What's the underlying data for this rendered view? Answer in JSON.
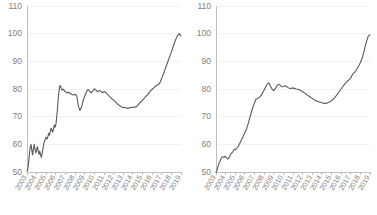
{
  "figure": {
    "title": "",
    "panel_count": 2,
    "background_color": "#ffffff",
    "line_color": "#595959",
    "axis_color": "#bfbfbf",
    "grid_color": "#f2f2f2",
    "tick_label_color": "#808080"
  },
  "chart_data": [
    {
      "type": "line",
      "title": "",
      "subtitle": "",
      "xlabel": "",
      "ylabel": "",
      "panel": "left",
      "grid": true,
      "legend": "none",
      "ylim": [
        50,
        110
      ],
      "yticks": [
        50,
        60,
        70,
        80,
        90,
        100,
        110
      ],
      "ytick_labels": [
        "50",
        "60",
        "70",
        "80",
        "90",
        "100",
        "110"
      ],
      "xlim": [
        2003,
        2019
      ],
      "xticks": [
        2003,
        2004,
        2005,
        2006,
        2007,
        2008,
        2009,
        2010,
        2011,
        2012,
        2013,
        2014,
        2015,
        2016,
        2017,
        2018,
        2019
      ],
      "xtick_labels": [
        "2003",
        "2004",
        "2005",
        "2006",
        "2007",
        "2008",
        "2009",
        "2010",
        "2011",
        "2012",
        "2013",
        "2014",
        "2015",
        "2016",
        "2017",
        "2018",
        "2019"
      ],
      "xtick_rotation": -60,
      "series": [
        {
          "name": "index",
          "color": "#595959",
          "x": [
            2003.0,
            2003.08,
            2003.17,
            2003.25,
            2003.33,
            2003.42,
            2003.5,
            2003.58,
            2003.67,
            2003.75,
            2003.83,
            2003.92,
            2004.0,
            2004.08,
            2004.17,
            2004.25,
            2004.33,
            2004.42,
            2004.5,
            2004.58,
            2004.67,
            2004.75,
            2004.83,
            2004.92,
            2005.0,
            2005.08,
            2005.17,
            2005.25,
            2005.33,
            2005.42,
            2005.5,
            2005.58,
            2005.67,
            2005.75,
            2005.83,
            2005.92,
            2006.0,
            2006.08,
            2006.17,
            2006.25,
            2006.33,
            2006.42,
            2006.5,
            2006.58,
            2006.67,
            2006.75,
            2006.83,
            2006.92,
            2007.0,
            2007.17,
            2007.33,
            2007.5,
            2007.67,
            2007.83,
            2008.0,
            2008.17,
            2008.33,
            2008.5,
            2008.67,
            2008.83,
            2009.0,
            2009.17,
            2009.33,
            2009.5,
            2009.67,
            2009.83,
            2010.0,
            2010.17,
            2010.33,
            2010.5,
            2010.67,
            2010.83,
            2011.0,
            2011.17,
            2011.33,
            2011.5,
            2011.67,
            2011.83,
            2012.0,
            2012.17,
            2012.33,
            2012.5,
            2012.67,
            2012.83,
            2013.0,
            2013.17,
            2013.33,
            2013.5,
            2013.67,
            2013.83,
            2014.0,
            2014.17,
            2014.33,
            2014.5,
            2014.67,
            2014.83,
            2015.0,
            2015.17,
            2015.33,
            2015.5,
            2015.67,
            2015.83,
            2016.0,
            2016.17,
            2016.33,
            2016.5,
            2016.67,
            2016.83,
            2017.0,
            2017.17,
            2017.33,
            2017.5,
            2017.67,
            2017.83,
            2018.0,
            2018.17,
            2018.33,
            2018.5,
            2018.67,
            2018.83,
            2019.0
          ],
          "values": [
            50.3,
            51.0,
            53.5,
            56.5,
            58.8,
            59.9,
            58.0,
            56.2,
            58.4,
            60.0,
            58.3,
            56.9,
            57.9,
            59.2,
            57.6,
            56.4,
            57.5,
            56.0,
            55.3,
            56.8,
            58.6,
            60.3,
            61.2,
            62.0,
            62.6,
            61.9,
            62.8,
            64.0,
            63.3,
            64.6,
            65.9,
            65.2,
            64.4,
            65.5,
            67.0,
            66.2,
            67.1,
            69.5,
            73.0,
            76.8,
            79.4,
            81.3,
            80.9,
            80.1,
            79.6,
            80.0,
            79.7,
            79.2,
            79.0,
            78.6,
            78.8,
            78.4,
            78.0,
            77.8,
            78.1,
            77.5,
            74.0,
            72.2,
            73.5,
            75.8,
            77.4,
            78.9,
            79.8,
            79.2,
            78.6,
            79.3,
            80.1,
            79.6,
            79.0,
            79.4,
            79.2,
            78.6,
            79.1,
            78.8,
            78.2,
            77.6,
            77.0,
            76.4,
            76.0,
            75.4,
            74.8,
            74.3,
            73.9,
            73.5,
            73.2,
            73.4,
            73.1,
            73.0,
            73.2,
            73.4,
            73.3,
            73.6,
            73.5,
            74.1,
            74.8,
            75.4,
            75.9,
            76.6,
            77.3,
            77.8,
            78.6,
            79.3,
            79.9,
            80.4,
            81.0,
            81.4,
            81.6,
            82.4,
            83.9,
            85.4,
            87.0,
            88.6,
            90.2,
            91.8,
            93.4,
            95.1,
            96.8,
            98.3,
            99.5,
            100.0,
            99.2
          ]
        }
      ]
    },
    {
      "type": "line",
      "title": "",
      "subtitle": "",
      "xlabel": "",
      "ylabel": "",
      "panel": "right",
      "grid": true,
      "legend": "none",
      "ylim": [
        50,
        110
      ],
      "yticks": [
        50,
        60,
        70,
        80,
        90,
        100,
        110
      ],
      "ytick_labels": [
        "50",
        "60",
        "70",
        "80",
        "90",
        "100",
        "110"
      ],
      "xlim": [
        2003,
        2019
      ],
      "xticks": [
        2003,
        2004,
        2005,
        2006,
        2007,
        2008,
        2009,
        2010,
        2011,
        2012,
        2013,
        2014,
        2015,
        2016,
        2017,
        2018,
        2019
      ],
      "xtick_labels": [
        "2003",
        "2004",
        "2005",
        "2006",
        "2007",
        "2008",
        "2009",
        "2010",
        "2011",
        "2012",
        "2013",
        "2014",
        "2015",
        "2016",
        "2017",
        "2018",
        "2019"
      ],
      "xtick_rotation": -60,
      "series": [
        {
          "name": "index",
          "color": "#595959",
          "x": [
            2003.0,
            2003.08,
            2003.17,
            2003.25,
            2003.33,
            2003.42,
            2003.5,
            2003.58,
            2003.67,
            2003.75,
            2003.83,
            2003.92,
            2004.0,
            2004.08,
            2004.17,
            2004.25,
            2004.33,
            2004.42,
            2004.5,
            2004.58,
            2004.67,
            2004.75,
            2004.83,
            2004.92,
            2005.0,
            2005.17,
            2005.33,
            2005.5,
            2005.67,
            2005.83,
            2006.0,
            2006.17,
            2006.33,
            2006.5,
            2006.67,
            2006.83,
            2007.0,
            2007.17,
            2007.33,
            2007.5,
            2007.67,
            2007.83,
            2008.0,
            2008.17,
            2008.33,
            2008.5,
            2008.67,
            2008.83,
            2009.0,
            2009.17,
            2009.33,
            2009.5,
            2009.67,
            2009.83,
            2010.0,
            2010.17,
            2010.33,
            2010.5,
            2010.67,
            2010.83,
            2011.0,
            2011.17,
            2011.33,
            2011.5,
            2011.67,
            2011.83,
            2012.0,
            2012.17,
            2012.33,
            2012.5,
            2012.67,
            2012.83,
            2013.0,
            2013.17,
            2013.33,
            2013.5,
            2013.67,
            2013.83,
            2014.0,
            2014.17,
            2014.33,
            2014.5,
            2014.67,
            2014.83,
            2015.0,
            2015.17,
            2015.33,
            2015.5,
            2015.67,
            2015.83,
            2016.0,
            2016.17,
            2016.33,
            2016.5,
            2016.67,
            2016.83,
            2017.0,
            2017.17,
            2017.33,
            2017.5,
            2017.67,
            2017.83,
            2018.0,
            2018.17,
            2018.33,
            2018.5,
            2018.67,
            2018.83,
            2019.0
          ],
          "values": [
            49.8,
            50.4,
            51.6,
            52.4,
            53.3,
            54.0,
            54.6,
            55.2,
            55.5,
            55.4,
            55.3,
            55.6,
            55.5,
            55.2,
            54.9,
            54.7,
            55.0,
            55.6,
            56.2,
            56.8,
            57.0,
            57.3,
            57.9,
            58.2,
            58.0,
            58.6,
            59.4,
            60.6,
            61.8,
            63.0,
            64.2,
            65.5,
            67.3,
            69.5,
            71.6,
            73.4,
            75.0,
            76.4,
            76.6,
            77.0,
            77.6,
            78.5,
            79.6,
            80.8,
            81.8,
            82.2,
            81.0,
            79.9,
            79.4,
            80.2,
            81.2,
            81.7,
            81.4,
            80.8,
            80.9,
            81.2,
            80.9,
            80.5,
            80.2,
            80.3,
            80.4,
            80.2,
            80.0,
            79.9,
            79.7,
            79.4,
            79.0,
            78.6,
            78.2,
            77.8,
            77.4,
            77.0,
            76.6,
            76.2,
            75.9,
            75.6,
            75.4,
            75.2,
            75.0,
            74.9,
            74.8,
            74.9,
            75.1,
            75.4,
            75.8,
            76.3,
            76.9,
            77.6,
            78.4,
            79.2,
            80.0,
            80.8,
            81.6,
            82.3,
            82.9,
            83.4,
            84.0,
            85.2,
            85.8,
            86.4,
            87.4,
            88.4,
            89.6,
            91.0,
            93.0,
            95.4,
            97.6,
            99.2,
            99.6
          ]
        }
      ]
    }
  ]
}
